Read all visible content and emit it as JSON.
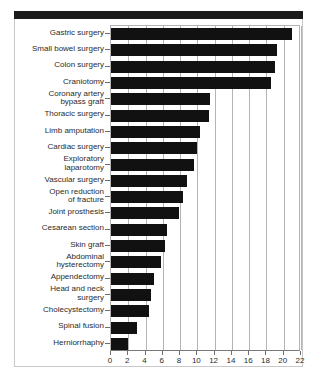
{
  "chart_data": {
    "type": "bar",
    "orientation": "horizontal",
    "title": "",
    "subtitle": "",
    "xlabel": "",
    "ylabel": "",
    "xlim": [
      0,
      22
    ],
    "ylim": null,
    "grid": true,
    "legend": null,
    "legend_position": "none",
    "bar_color": "#111111",
    "categories": [
      "Gastric surgery",
      "Small bowel surgery",
      "Colon surgery",
      "Craniotomy",
      "Coronary artery\nbypass graft",
      "Thoracic surgery",
      "Limb amputation",
      "Cardiac surgery",
      "Exploratory\nlaparotomy",
      "Vascular surgery",
      "Open reduction\nof fracture",
      "Joint prosthesis",
      "Cesarean section",
      "Skin graft",
      "Abdominal\nhysterectomy",
      "Appendectomy",
      "Head and neck\nsurgery",
      "Cholecystectomy",
      "Spinal fusion",
      "Herniorrhaphy"
    ],
    "values": [
      21.0,
      19.2,
      19.0,
      18.5,
      11.5,
      11.3,
      10.3,
      10.0,
      9.6,
      8.8,
      8.3,
      7.9,
      6.5,
      6.2,
      5.8,
      5.0,
      4.6,
      4.4,
      3.0,
      2.0
    ],
    "xticks": [
      0,
      2,
      4,
      6,
      8,
      10,
      12,
      14,
      16,
      18,
      20,
      22
    ],
    "xtick_labels": [
      "0",
      "2",
      "4",
      "6",
      "8",
      "10",
      "12",
      "14",
      "16",
      "18",
      "20",
      "22"
    ]
  }
}
